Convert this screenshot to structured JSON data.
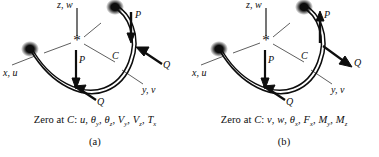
{
  "figure": {
    "background_color": "#ffffff",
    "ink_color": "#0d0d0d"
  },
  "panels": [
    {
      "id": "a",
      "sublabel": "(a)",
      "caption_prefix": "Zero at ",
      "caption_point": "C",
      "caption_colon": ": ",
      "caption_quantities": [
        {
          "sym": "u",
          "sub": ""
        },
        {
          "sym": "θ",
          "sub": "y"
        },
        {
          "sym": "θ",
          "sub": "z"
        },
        {
          "sym": "V",
          "sub": "y"
        },
        {
          "sym": "V",
          "sub": "z"
        },
        {
          "sym": "T",
          "sub": "x"
        }
      ],
      "caption_text": "Zero at C: u, θy, θz, Vy, Vz, Tx",
      "axes": [
        {
          "name": "z-axis-label",
          "text": "z, w"
        },
        {
          "name": "x-axis-label",
          "text": "x, u"
        },
        {
          "name": "y-axis-label",
          "text": "y, v"
        }
      ],
      "origin_marker": "*",
      "midpoint_label": "C",
      "loads": [
        {
          "name": "load-P-left",
          "text": "P",
          "direction": "down"
        },
        {
          "name": "load-Q-left",
          "text": "Q",
          "direction": "up-right-into-beam"
        },
        {
          "name": "load-P-right",
          "text": "P",
          "direction": "down"
        },
        {
          "name": "load-Q-right",
          "text": "Q",
          "direction": "down-left-into-beam"
        }
      ]
    },
    {
      "id": "b",
      "sublabel": "(b)",
      "caption_prefix": "Zero at ",
      "caption_point": "C",
      "caption_colon": ": ",
      "caption_quantities": [
        {
          "sym": "v",
          "sub": ""
        },
        {
          "sym": "w",
          "sub": ""
        },
        {
          "sym": "θ",
          "sub": "x"
        },
        {
          "sym": "F",
          "sub": "x"
        },
        {
          "sym": "M",
          "sub": "y"
        },
        {
          "sym": "M",
          "sub": "z"
        }
      ],
      "caption_text": "Zero at C: v, w, θx, Fx, My, Mz",
      "axes": [
        {
          "name": "z-axis-label",
          "text": "z, w"
        },
        {
          "name": "x-axis-label",
          "text": "x, u"
        },
        {
          "name": "y-axis-label",
          "text": "y, v"
        }
      ],
      "origin_marker": "*",
      "midpoint_label": "C",
      "loads": [
        {
          "name": "load-P-left",
          "text": "P",
          "direction": "down"
        },
        {
          "name": "load-Q-left",
          "text": "Q",
          "direction": "up-right-into-beam"
        },
        {
          "name": "load-P-right",
          "text": "P",
          "direction": "up"
        },
        {
          "name": "load-Q-right",
          "text": "Q",
          "direction": "down-right-away-from-beam"
        }
      ]
    }
  ]
}
